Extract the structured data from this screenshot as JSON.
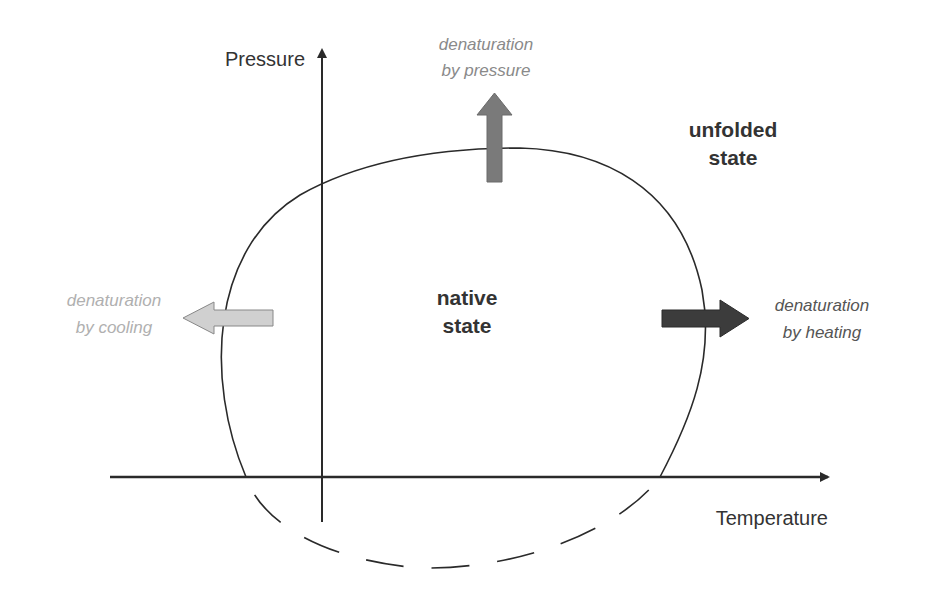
{
  "axes": {
    "y_label": "Pressure",
    "x_label": "Temperature"
  },
  "regions": {
    "native_line1": "native",
    "native_line2": "state",
    "unfolded_line1": "unfolded",
    "unfolded_line2": "state"
  },
  "arrows": {
    "pressure": {
      "line1": "denaturation",
      "line2": "by pressure",
      "color": "#7a7a7a"
    },
    "cooling": {
      "line1": "denaturation",
      "line2": "by cooling",
      "color": "#c8c8c8"
    },
    "heating": {
      "line1": "denaturation",
      "line2": "by heating",
      "color": "#3a3a3a"
    }
  },
  "colors": {
    "line": "#2a2a2a",
    "label_dark": "#333333",
    "label_mid": "#555555",
    "label_light": "#b0b0b0",
    "label_pressure": "#8a8a8a"
  }
}
